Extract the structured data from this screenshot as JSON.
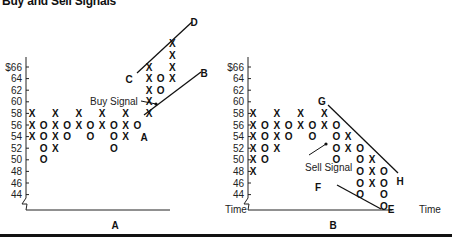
{
  "title": "Buy and Sell Signals",
  "chart_data": [
    {
      "type": "point-and-figure",
      "panel_label": "A",
      "xlabel": "Time",
      "ylabel": "",
      "yticks": [
        "$66",
        "64",
        "62",
        "60",
        "58",
        "56",
        "54",
        "52",
        "50",
        "48",
        "46",
        "44"
      ],
      "ylim": [
        44,
        70
      ],
      "annotation": "Buy Signal",
      "columns": [
        {
          "col": 1,
          "type": "X",
          "values": [
            58,
            56,
            54
          ]
        },
        {
          "col": 2,
          "type": "O",
          "values": [
            56,
            54,
            52,
            50
          ]
        },
        {
          "col": 3,
          "type": "X",
          "values": [
            52,
            54,
            56,
            58
          ]
        },
        {
          "col": 4,
          "type": "O",
          "values": [
            56,
            54
          ]
        },
        {
          "col": 5,
          "type": "X",
          "values": [
            56,
            58
          ]
        },
        {
          "col": 6,
          "type": "O",
          "values": [
            56,
            54
          ]
        },
        {
          "col": 7,
          "type": "X",
          "values": [
            56,
            58
          ]
        },
        {
          "col": 8,
          "type": "O",
          "values": [
            56,
            54,
            52
          ]
        },
        {
          "col": 9,
          "type": "X",
          "values": [
            54,
            56,
            58
          ]
        },
        {
          "col": 10,
          "type": "O",
          "values": [
            56
          ]
        },
        {
          "col": 11,
          "type": "X",
          "values": [
            58,
            60,
            62,
            64,
            66
          ]
        },
        {
          "col": 12,
          "type": "O",
          "values": [
            64,
            62
          ]
        },
        {
          "col": 13,
          "type": "X",
          "values": [
            64,
            66,
            68,
            70
          ]
        }
      ],
      "trendlines": [
        {
          "from": "A",
          "to": "B",
          "kind": "support"
        },
        {
          "from": "C",
          "to": "D",
          "kind": "parallel"
        }
      ],
      "point_labels": [
        "A",
        "B",
        "C",
        "D"
      ]
    },
    {
      "type": "point-and-figure",
      "panel_label": "B",
      "xlabel": "Time",
      "ylabel": "",
      "yticks": [
        "$66",
        "64",
        "62",
        "60",
        "58",
        "56",
        "54",
        "52",
        "50",
        "48",
        "46",
        "44"
      ],
      "ylim": [
        42,
        66
      ],
      "annotation": "Sell Signal",
      "columns": [
        {
          "col": 1,
          "type": "X",
          "values": [
            58,
            56,
            54,
            52,
            50,
            48
          ]
        },
        {
          "col": 2,
          "type": "O",
          "values": [
            56,
            54,
            52,
            50
          ]
        },
        {
          "col": 3,
          "type": "X",
          "values": [
            52,
            54,
            56,
            58
          ]
        },
        {
          "col": 4,
          "type": "O",
          "values": [
            56,
            54
          ]
        },
        {
          "col": 5,
          "type": "X",
          "values": [
            56,
            58
          ]
        },
        {
          "col": 6,
          "type": "O",
          "values": [
            56,
            54
          ]
        },
        {
          "col": 7,
          "type": "X",
          "values": [
            56,
            58
          ]
        },
        {
          "col": 8,
          "type": "O",
          "values": [
            56,
            54,
            52,
            50
          ]
        },
        {
          "col": 9,
          "type": "X",
          "values": [
            52,
            54
          ]
        },
        {
          "col": 10,
          "type": "O",
          "values": [
            52,
            50,
            48,
            46,
            44
          ]
        },
        {
          "col": 11,
          "type": "X",
          "values": [
            46,
            48,
            50
          ]
        },
        {
          "col": 12,
          "type": "O",
          "values": [
            48,
            46,
            44,
            42
          ]
        }
      ],
      "trendlines": [
        {
          "from": "G",
          "to": "H",
          "kind": "resistance"
        },
        {
          "from": "F",
          "to": "E",
          "kind": "parallel"
        }
      ],
      "point_labels": [
        "G",
        "H",
        "F",
        "E"
      ]
    }
  ]
}
